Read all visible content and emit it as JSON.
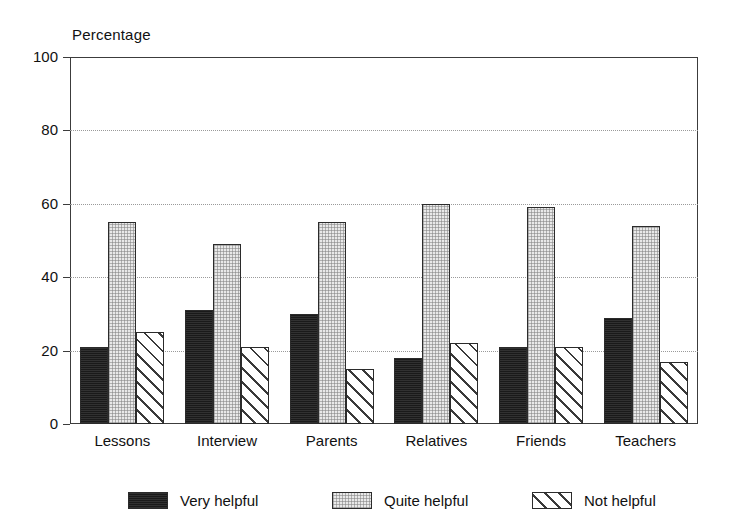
{
  "chart_data": {
    "type": "bar",
    "title": "",
    "subtitle": "",
    "xlabel": "",
    "ylabel": "Percentage",
    "ylim": [
      0,
      100
    ],
    "yticks": [
      0,
      20,
      40,
      60,
      80,
      100
    ],
    "grid": "horizontal-dotted",
    "legend_position": "bottom",
    "categories": [
      "Lessons",
      "Interview",
      "Parents",
      "Relatives",
      "Friends",
      "Teachers"
    ],
    "series": [
      {
        "name": "Very helpful",
        "pattern": "solid-black",
        "values": [
          21,
          31,
          30,
          18,
          21,
          29
        ]
      },
      {
        "name": "Quite helpful",
        "pattern": "light-stipple",
        "values": [
          55,
          49,
          55,
          60,
          59,
          54
        ]
      },
      {
        "name": "Not helpful",
        "pattern": "diagonal-hatch",
        "values": [
          25,
          21,
          15,
          22,
          21,
          17
        ]
      }
    ]
  },
  "axis": {
    "y_title": "Percentage",
    "y_tick_labels": [
      "100",
      "80",
      "60",
      "40",
      "20",
      "0"
    ],
    "x_tick_labels": [
      "Lessons",
      "Interview",
      "Parents",
      "Relatives",
      "Friends",
      "Teachers"
    ]
  },
  "legend": {
    "items": [
      {
        "label": "Very helpful"
      },
      {
        "label": "Quite helpful"
      },
      {
        "label": "Not helpful"
      }
    ]
  },
  "colors": {
    "very_helpful": "#1a1a1a",
    "quite_helpful": "#e9e9e9",
    "not_helpful": "#ffffff",
    "axis": "#3c3c3c",
    "grid": "#9a9a9a",
    "background": "#ffffff"
  }
}
